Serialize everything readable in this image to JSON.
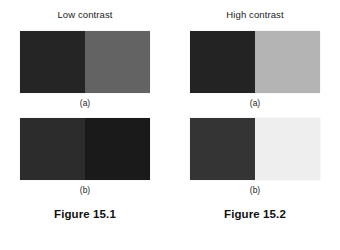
{
  "page": {
    "background": "#ffffff",
    "text_color": "#1c1c1c"
  },
  "figures": [
    {
      "heading": "Low contrast",
      "caption": "Figure 15.1",
      "panels": [
        {
          "label": "(a)",
          "left_color": "#252525",
          "right_color": "#636363"
        },
        {
          "label": "(b)",
          "left_color": "#2c2c2c",
          "right_color": "#1a1a1a"
        }
      ]
    },
    {
      "heading": "High contrast",
      "caption": "Figure 15.2",
      "panels": [
        {
          "label": "(a)",
          "left_color": "#232323",
          "right_color": "#b4b4b4"
        },
        {
          "label": "(b)",
          "left_color": "#343434",
          "right_color": "#eeeeee"
        }
      ]
    }
  ]
}
